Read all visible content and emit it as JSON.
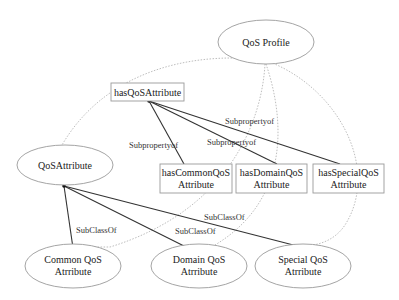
{
  "nodes": {
    "qos_profile": {
      "label": "QoS Profile",
      "shape": "ellipse"
    },
    "has_qos_attribute": {
      "label": "hasQoSAttribute",
      "shape": "box"
    },
    "qos_attribute": {
      "label": "QoSAttribute",
      "shape": "ellipse"
    },
    "has_common": {
      "line1": "hasCommonQoS",
      "line2": "Attribute",
      "shape": "box"
    },
    "has_domain": {
      "line1": "hasDomainQoS",
      "line2": "Attribute",
      "shape": "box"
    },
    "has_special": {
      "line1": "hasSpecialQoS",
      "line2": "Attribute",
      "shape": "box"
    },
    "common_qos": {
      "line1": "Common QoS",
      "line2": "Atrribute",
      "shape": "ellipse"
    },
    "domain_qos": {
      "line1": "Domain QoS",
      "line2": "Atrribute",
      "shape": "ellipse"
    },
    "special_qos": {
      "line1": "Special QoS",
      "line2": "Atrribute",
      "shape": "ellipse"
    }
  },
  "edges": {
    "subprop_common": {
      "from": "hasCommonQoS Attribute",
      "to": "hasQoSAttribute",
      "label": "Subpropertyof",
      "style": "solid"
    },
    "subprop_domain": {
      "from": "hasDomainQoS Attribute",
      "to": "hasQoSAttribute",
      "label": "Subpropertyof",
      "style": "solid"
    },
    "subprop_special": {
      "from": "hasSpecialQoS Attribute",
      "to": "hasQoSAttribute",
      "label": "Subpropertyof",
      "style": "solid"
    },
    "subclass_common": {
      "from": "Common QoS Atrribute",
      "to": "QoSAttribute",
      "label": "SubClassOf",
      "style": "solid"
    },
    "subclass_domain": {
      "from": "Domain QoS Atrribute",
      "to": "QoSAttribute",
      "label": "SubClassOf",
      "style": "solid"
    },
    "subclass_special": {
      "from": "Special QoS Atrribute",
      "to": "QoSAttribute",
      "label": "SubClassOf",
      "style": "solid"
    },
    "profile_to_attribute": {
      "from": "QoS Profile",
      "to": "QoSAttribute",
      "via": "hasQoSAttribute",
      "style": "dotted"
    },
    "profile_to_common": {
      "from": "QoS Profile",
      "to": "Common QoS Atrribute",
      "via": "hasCommonQoS Attribute",
      "style": "dotted"
    },
    "profile_to_domain": {
      "from": "QoS Profile",
      "to": "Domain QoS Atrribute",
      "via": "hasDomainQoS Attribute",
      "style": "dotted"
    },
    "profile_to_special": {
      "from": "QoS Profile",
      "to": "Special QoS Atrribute",
      "via": "hasSpecialQoS Attribute",
      "style": "dotted"
    }
  },
  "colors": {
    "node_stroke": "#9a9a9a",
    "solid_edge": "#333333",
    "dotted_edge": "#b5b5b5",
    "text": "#222222"
  }
}
